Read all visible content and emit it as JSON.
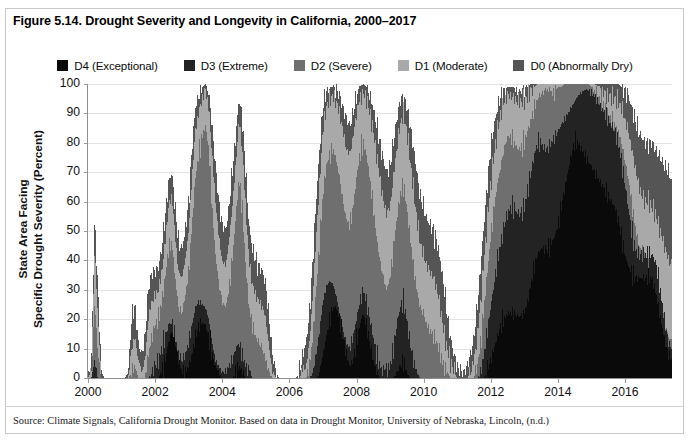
{
  "figure": {
    "title": "Figure 5.14. Drought Severity and Longevity in California, 2000–2017",
    "source": "Source: Climate Signals, California Drought Monitor. Based on data in Drought Monitor, University of Nebraska, Lincoln, (n.d.)"
  },
  "colors": {
    "d4": "#0a0a0a",
    "d3": "#232323",
    "d2": "#6f6f6f",
    "d1": "#a9a9a9",
    "d0": "#555555",
    "grid": "#e3e3e3",
    "axis": "#8f8f8f",
    "text": "#111111",
    "frame": "#c9c9c9"
  },
  "legend": {
    "position": "top-center",
    "items": [
      {
        "key": "d4",
        "label": "D4 (Exceptional)",
        "color": "#0a0a0a"
      },
      {
        "key": "d3",
        "label": "D3 (Extreme)",
        "color": "#232323"
      },
      {
        "key": "d2",
        "label": "D2 (Severe)",
        "color": "#6f6f6f"
      },
      {
        "key": "d1",
        "label": "D1 (Moderate)",
        "color": "#a9a9a9"
      },
      {
        "key": "d0",
        "label": "D0 (Abnormally Dry)",
        "color": "#555555"
      }
    ]
  },
  "axes": {
    "y": {
      "label_line1": "State Area Facing",
      "label_line2": "Specific Drought Severity (Percent)",
      "ticks": [
        0,
        10,
        20,
        30,
        40,
        50,
        60,
        70,
        80,
        90,
        100
      ],
      "min": 0,
      "max": 100
    },
    "x": {
      "ticks": [
        2000,
        2002,
        2004,
        2006,
        2008,
        2010,
        2012,
        2014,
        2016
      ],
      "min": 2000,
      "max": 2017.4
    }
  },
  "chart_data": {
    "type": "area",
    "title": "Figure 5.14. Drought Severity and Longevity in California, 2000–2017",
    "xlabel": "",
    "ylabel": "State Area Facing Specific Drought Severity (Percent)",
    "xlim": [
      2000,
      2017.4
    ],
    "ylim": [
      0,
      100
    ],
    "grid": true,
    "legend_position": "top-center",
    "stacking": "overlay",
    "note": "Each series is a cumulative envelope: D0 is total area at D0 or worse, D1 at D1 or worse, etc. Values are percent of California land area, sampled roughly monthly.",
    "x": [
      2000.0,
      2000.1,
      2000.2,
      2000.3,
      2000.4,
      2000.5,
      2000.6,
      2000.7,
      2000.8,
      2000.9,
      2001.0,
      2001.1,
      2001.2,
      2001.3,
      2001.4,
      2001.5,
      2001.6,
      2001.7,
      2001.8,
      2001.9,
      2002.0,
      2002.1,
      2002.2,
      2002.3,
      2002.4,
      2002.5,
      2002.6,
      2002.7,
      2002.8,
      2002.9,
      2003.0,
      2003.1,
      2003.2,
      2003.3,
      2003.4,
      2003.5,
      2003.6,
      2003.7,
      2003.8,
      2003.9,
      2004.0,
      2004.1,
      2004.2,
      2004.3,
      2004.4,
      2004.5,
      2004.6,
      2004.7,
      2004.8,
      2004.9,
      2005.0,
      2005.1,
      2005.2,
      2005.3,
      2005.4,
      2005.5,
      2005.6,
      2005.7,
      2005.8,
      2005.9,
      2006.0,
      2006.1,
      2006.2,
      2006.3,
      2006.4,
      2006.5,
      2006.6,
      2006.7,
      2006.8,
      2006.9,
      2007.0,
      2007.1,
      2007.2,
      2007.3,
      2007.4,
      2007.5,
      2007.6,
      2007.7,
      2007.8,
      2007.9,
      2008.0,
      2008.1,
      2008.2,
      2008.3,
      2008.4,
      2008.5,
      2008.6,
      2008.7,
      2008.8,
      2008.9,
      2009.0,
      2009.1,
      2009.2,
      2009.3,
      2009.4,
      2009.5,
      2009.6,
      2009.7,
      2009.8,
      2009.9,
      2010.0,
      2010.1,
      2010.2,
      2010.3,
      2010.4,
      2010.5,
      2010.6,
      2010.7,
      2010.8,
      2010.9,
      2011.0,
      2011.1,
      2011.2,
      2011.3,
      2011.4,
      2011.5,
      2011.6,
      2011.7,
      2011.8,
      2011.9,
      2012.0,
      2012.1,
      2012.2,
      2012.3,
      2012.4,
      2012.5,
      2012.6,
      2012.7,
      2012.8,
      2012.9,
      2013.0,
      2013.1,
      2013.2,
      2013.3,
      2013.4,
      2013.5,
      2013.6,
      2013.7,
      2013.8,
      2013.9,
      2014.0,
      2014.1,
      2014.2,
      2014.3,
      2014.4,
      2014.5,
      2014.6,
      2014.7,
      2014.8,
      2014.9,
      2015.0,
      2015.1,
      2015.2,
      2015.3,
      2015.4,
      2015.5,
      2015.6,
      2015.7,
      2015.8,
      2015.9,
      2016.0,
      2016.1,
      2016.2,
      2016.3,
      2016.4,
      2016.5,
      2016.6,
      2016.7,
      2016.8,
      2016.9,
      2017.0,
      2017.1,
      2017.2,
      2017.3,
      2017.4
    ],
    "series": [
      {
        "name": "D0 (Abnormally Dry)",
        "color": "#555555",
        "values": [
          0,
          5,
          54,
          30,
          2,
          0,
          0,
          0,
          0,
          0,
          0,
          0,
          2,
          20,
          25,
          12,
          8,
          14,
          30,
          36,
          36,
          38,
          44,
          55,
          66,
          70,
          58,
          46,
          44,
          50,
          60,
          78,
          92,
          96,
          99,
          100,
          97,
          86,
          72,
          60,
          52,
          50,
          58,
          70,
          82,
          95,
          88,
          70,
          52,
          44,
          40,
          38,
          36,
          32,
          20,
          8,
          2,
          0,
          0,
          0,
          0,
          0,
          0,
          2,
          8,
          12,
          22,
          40,
          60,
          78,
          92,
          98,
          99,
          99,
          98,
          96,
          92,
          88,
          86,
          90,
          96,
          99,
          100,
          99,
          96,
          92,
          86,
          80,
          74,
          70,
          72,
          80,
          88,
          94,
          96,
          92,
          86,
          78,
          70,
          62,
          58,
          54,
          52,
          50,
          46,
          40,
          32,
          22,
          14,
          8,
          4,
          2,
          2,
          4,
          8,
          14,
          24,
          38,
          52,
          66,
          78,
          86,
          92,
          96,
          98,
          99,
          99,
          99,
          98,
          98,
          98,
          99,
          100,
          100,
          100,
          100,
          100,
          100,
          100,
          100,
          100,
          100,
          100,
          100,
          100,
          100,
          100,
          100,
          100,
          100,
          100,
          100,
          100,
          100,
          100,
          100,
          100,
          100,
          100,
          99,
          98,
          96,
          92,
          88,
          84,
          82,
          80,
          80,
          80,
          78,
          76,
          74,
          72,
          70,
          68
        ]
      },
      {
        "name": "D1 (Moderate)",
        "color": "#a9a9a9",
        "values": [
          0,
          2,
          44,
          20,
          0,
          0,
          0,
          0,
          0,
          0,
          0,
          0,
          0,
          10,
          14,
          6,
          2,
          6,
          20,
          26,
          28,
          30,
          36,
          46,
          58,
          62,
          48,
          36,
          34,
          40,
          50,
          68,
          84,
          90,
          95,
          98,
          92,
          76,
          60,
          48,
          40,
          38,
          46,
          58,
          72,
          88,
          78,
          58,
          40,
          32,
          28,
          26,
          24,
          20,
          10,
          2,
          0,
          0,
          0,
          0,
          0,
          0,
          0,
          0,
          2,
          4,
          12,
          28,
          48,
          66,
          84,
          92,
          95,
          96,
          94,
          90,
          84,
          78,
          76,
          82,
          90,
          95,
          97,
          95,
          90,
          84,
          76,
          68,
          60,
          56,
          58,
          68,
          78,
          86,
          90,
          84,
          74,
          64,
          54,
          46,
          42,
          38,
          36,
          34,
          30,
          24,
          16,
          10,
          6,
          2,
          0,
          0,
          0,
          0,
          2,
          6,
          14,
          26,
          40,
          54,
          66,
          76,
          84,
          90,
          94,
          96,
          96,
          95,
          94,
          94,
          94,
          96,
          98,
          99,
          100,
          100,
          100,
          100,
          100,
          100,
          100,
          100,
          100,
          100,
          100,
          100,
          100,
          100,
          100,
          100,
          100,
          100,
          99,
          98,
          97,
          96,
          96,
          95,
          94,
          92,
          88,
          84,
          78,
          72,
          66,
          62,
          60,
          60,
          58,
          56,
          52,
          48,
          44,
          40,
          38
        ]
      },
      {
        "name": "D2 (Severe)",
        "color": "#6f6f6f",
        "values": [
          0,
          0,
          26,
          8,
          0,
          0,
          0,
          0,
          0,
          0,
          0,
          0,
          0,
          2,
          4,
          0,
          0,
          0,
          8,
          14,
          18,
          20,
          26,
          34,
          44,
          46,
          34,
          24,
          22,
          28,
          36,
          52,
          68,
          76,
          82,
          86,
          78,
          58,
          42,
          32,
          26,
          24,
          30,
          40,
          54,
          68,
          58,
          38,
          24,
          18,
          14,
          12,
          10,
          6,
          2,
          0,
          0,
          0,
          0,
          0,
          0,
          0,
          0,
          0,
          0,
          0,
          4,
          14,
          30,
          46,
          62,
          72,
          76,
          78,
          74,
          68,
          60,
          54,
          52,
          58,
          68,
          76,
          80,
          76,
          68,
          58,
          48,
          40,
          34,
          30,
          34,
          44,
          54,
          62,
          66,
          58,
          48,
          38,
          30,
          24,
          22,
          18,
          16,
          14,
          12,
          8,
          4,
          2,
          0,
          0,
          0,
          0,
          0,
          0,
          0,
          0,
          4,
          12,
          24,
          36,
          48,
          58,
          66,
          72,
          78,
          82,
          82,
          80,
          78,
          78,
          80,
          84,
          88,
          92,
          95,
          97,
          98,
          98,
          98,
          98,
          99,
          99,
          100,
          100,
          100,
          100,
          100,
          100,
          100,
          100,
          99,
          98,
          96,
          94,
          92,
          90,
          88,
          86,
          84,
          80,
          74,
          68,
          60,
          52,
          46,
          42,
          40,
          40,
          38,
          36,
          30,
          24,
          18,
          14,
          12
        ]
      },
      {
        "name": "D3 (Extreme)",
        "color": "#232323",
        "values": [
          0,
          0,
          6,
          0,
          0,
          0,
          0,
          0,
          0,
          0,
          0,
          0,
          0,
          0,
          0,
          0,
          0,
          0,
          0,
          2,
          4,
          6,
          10,
          14,
          18,
          19,
          14,
          8,
          6,
          8,
          12,
          18,
          24,
          26,
          25,
          24,
          20,
          12,
          6,
          4,
          2,
          2,
          4,
          6,
          10,
          12,
          8,
          4,
          2,
          0,
          0,
          0,
          0,
          0,
          0,
          0,
          0,
          0,
          0,
          0,
          0,
          0,
          0,
          0,
          0,
          0,
          0,
          2,
          8,
          16,
          26,
          31,
          33,
          32,
          28,
          22,
          16,
          12,
          10,
          14,
          20,
          26,
          30,
          26,
          20,
          14,
          8,
          4,
          2,
          2,
          4,
          10,
          18,
          24,
          26,
          20,
          12,
          6,
          2,
          0,
          0,
          0,
          0,
          0,
          0,
          0,
          0,
          0,
          0,
          0,
          0,
          0,
          0,
          0,
          0,
          0,
          0,
          2,
          8,
          16,
          24,
          32,
          40,
          46,
          52,
          56,
          58,
          58,
          56,
          56,
          58,
          64,
          70,
          76,
          80,
          80,
          78,
          78,
          80,
          82,
          84,
          86,
          88,
          90,
          92,
          94,
          96,
          97,
          98,
          98,
          97,
          96,
          94,
          92,
          90,
          88,
          86,
          84,
          80,
          74,
          66,
          58,
          50,
          44,
          42,
          42,
          42,
          42,
          42,
          40,
          34,
          26,
          18,
          12,
          10
        ]
      },
      {
        "name": "D4 (Exceptional)",
        "color": "#0a0a0a",
        "values": [
          0,
          0,
          0,
          0,
          0,
          0,
          0,
          0,
          0,
          0,
          0,
          0,
          0,
          0,
          0,
          0,
          0,
          0,
          0,
          0,
          0,
          0,
          2,
          6,
          12,
          16,
          12,
          6,
          2,
          2,
          4,
          8,
          14,
          18,
          19,
          18,
          14,
          8,
          4,
          2,
          0,
          0,
          0,
          0,
          2,
          4,
          2,
          0,
          0,
          0,
          0,
          0,
          0,
          0,
          0,
          0,
          0,
          0,
          0,
          0,
          0,
          0,
          0,
          0,
          0,
          0,
          0,
          0,
          0,
          2,
          8,
          14,
          20,
          24,
          24,
          20,
          14,
          8,
          4,
          6,
          12,
          18,
          22,
          18,
          12,
          6,
          2,
          0,
          0,
          0,
          0,
          0,
          2,
          4,
          6,
          2,
          0,
          0,
          0,
          0,
          0,
          0,
          0,
          0,
          0,
          0,
          0,
          0,
          0,
          0,
          0,
          0,
          0,
          0,
          0,
          0,
          0,
          0,
          0,
          2,
          6,
          10,
          14,
          18,
          20,
          22,
          22,
          22,
          21,
          21,
          22,
          26,
          32,
          38,
          42,
          44,
          44,
          44,
          46,
          48,
          52,
          58,
          64,
          70,
          76,
          80,
          80,
          78,
          76,
          74,
          72,
          70,
          68,
          66,
          64,
          62,
          60,
          58,
          54,
          48,
          42,
          38,
          36,
          34,
          34,
          34,
          34,
          34,
          34,
          30,
          24,
          18,
          12,
          8,
          6
        ]
      }
    ]
  }
}
